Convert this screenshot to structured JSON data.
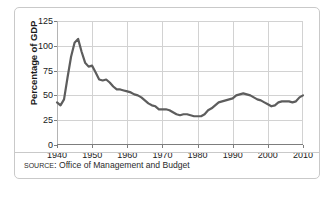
{
  "figure": {
    "source_label": "SOURCE:",
    "source_text": "Office of Management and Budget"
  },
  "chart_data": {
    "type": "line",
    "title": "",
    "xlabel": "",
    "ylabel": "Percentage of GDP",
    "xlim": [
      1940,
      2010
    ],
    "ylim": [
      0,
      125
    ],
    "grid": true,
    "legend": "none",
    "line_color": "#5d5d5d",
    "y_ticks": [
      0,
      25,
      50,
      75,
      100,
      125
    ],
    "y_tick_labels": [
      "0",
      "25",
      "50",
      "75",
      "100",
      "125"
    ],
    "x_ticks": [
      1940,
      1950,
      1960,
      1970,
      1980,
      1990,
      2000,
      2010
    ],
    "x_tick_labels": [
      "1940",
      "1950",
      "1960",
      "1970",
      "1980",
      "1990",
      "2000",
      "2010"
    ],
    "series": [
      {
        "name": "Federal debt as percentage of GDP",
        "x": [
          1940,
          1941,
          1942,
          1943,
          1944,
          1945,
          1946,
          1947,
          1948,
          1949,
          1950,
          1951,
          1952,
          1953,
          1954,
          1955,
          1956,
          1957,
          1958,
          1959,
          1960,
          1961,
          1962,
          1963,
          1964,
          1965,
          1966,
          1967,
          1968,
          1969,
          1970,
          1971,
          1972,
          1973,
          1974,
          1975,
          1976,
          1977,
          1978,
          1979,
          1980,
          1981,
          1982,
          1983,
          1984,
          1985,
          1986,
          1987,
          1988,
          1989,
          1990,
          1991,
          1992,
          1993,
          1994,
          1995,
          1996,
          1997,
          1998,
          1999,
          2000,
          2001,
          2002,
          2003,
          2004,
          2005,
          2006,
          2007,
          2008,
          2009,
          2010
        ],
        "values": [
          43,
          40,
          46,
          68,
          89,
          103,
          107,
          94,
          83,
          79,
          80,
          73,
          66,
          65,
          66,
          63,
          59,
          56,
          56,
          55,
          54,
          53,
          51,
          50,
          48,
          45,
          42,
          40,
          39,
          36,
          36,
          36,
          35,
          33,
          31,
          30,
          31,
          31,
          30,
          29,
          29,
          29,
          31,
          35,
          37,
          40,
          43,
          44,
          45,
          46,
          47,
          50,
          51,
          52,
          51,
          50,
          48,
          46,
          45,
          43,
          41,
          39,
          40,
          43,
          44,
          44,
          44,
          43,
          44,
          48,
          50
        ]
      }
    ]
  }
}
